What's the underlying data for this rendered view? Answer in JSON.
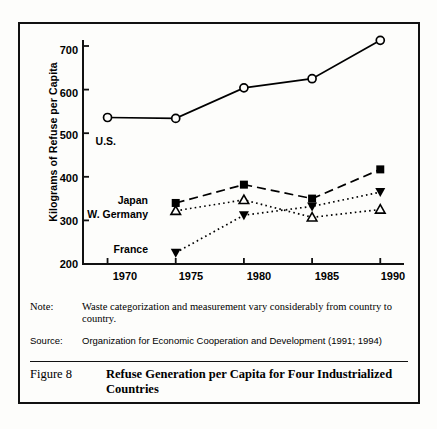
{
  "figure": {
    "number_label": "Figure 8",
    "title": "Refuse Generation per Capita for Four Industrialized Countries",
    "note_key": "Note:",
    "note_text": "Waste categorization and measurement vary considerably from country to country.",
    "source_key": "Source:",
    "source_text": "Organization for Economic Cooperation and Development (1991; 1994)"
  },
  "chart_data": {
    "type": "line",
    "title": "",
    "xlabel": "",
    "ylabel": "Kilograms of Refuse per Capita",
    "x": [
      1970,
      1975,
      1980,
      1985,
      1990
    ],
    "xticklabels": [
      "1970",
      "1975",
      "1980",
      "1985",
      "1990"
    ],
    "yticklabels": [
      "200",
      "300",
      "400",
      "500",
      "600",
      "700"
    ],
    "yticks": [
      200,
      300,
      400,
      500,
      600,
      700
    ],
    "xlim": [
      1968,
      1991
    ],
    "ylim": [
      200,
      700
    ],
    "grid": false,
    "legend": "inline-labels",
    "series": [
      {
        "name": "U.S.",
        "label": "U.S.",
        "marker": "open-circle",
        "line": "solid",
        "color": "#000000",
        "x": [
          1970,
          1975,
          1980,
          1985,
          1990
        ],
        "values": [
          536,
          534,
          604,
          625,
          713
        ]
      },
      {
        "name": "Japan",
        "label": "Japan",
        "marker": "filled-square",
        "line": "dashed",
        "color": "#000000",
        "x": [
          1975,
          1980,
          1985,
          1990
        ],
        "values": [
          340,
          382,
          350,
          417
        ]
      },
      {
        "name": "W. Germany",
        "label": "W. Germany",
        "marker": "open-triangle",
        "line": "dotted",
        "color": "#000000",
        "x": [
          1975,
          1980,
          1985,
          1990
        ],
        "values": [
          322,
          347,
          307,
          325
        ]
      },
      {
        "name": "France",
        "label": "France",
        "marker": "filled-down-triangle",
        "line": "dotted",
        "color": "#000000",
        "x": [
          1975,
          1980,
          1985,
          1990
        ],
        "values": [
          226,
          312,
          332,
          365
        ]
      }
    ]
  }
}
